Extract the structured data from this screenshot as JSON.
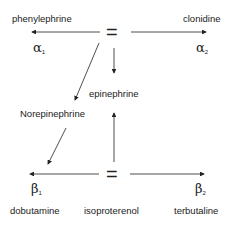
{
  "diagram": {
    "drugs": {
      "phenylephrine": "phenylephrine",
      "clonidine": "clonidine",
      "epinephrine": "epinephrine",
      "norepinephrine": "Norepinephrine",
      "dobutamine": "dobutamine",
      "isoproterenol": "isoproterenol",
      "terbutaline": "terbutaline"
    },
    "receptors": {
      "alpha1": {
        "symbol": "α",
        "sub": "1"
      },
      "alpha2": {
        "symbol": "α",
        "sub": "2"
      },
      "beta1": {
        "symbol": "β",
        "sub": "1"
      },
      "beta2": {
        "symbol": "β",
        "sub": "2"
      }
    },
    "equals_top": "=",
    "equals_bottom": "="
  }
}
